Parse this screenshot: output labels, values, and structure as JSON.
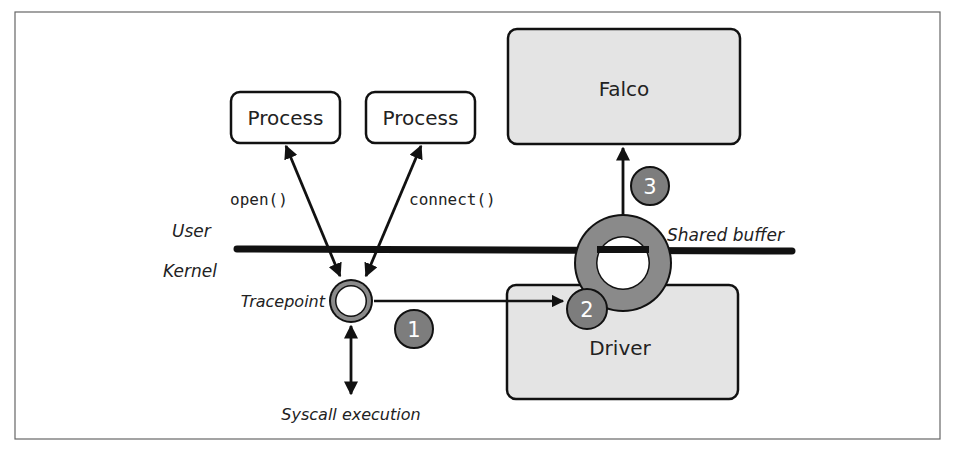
{
  "colors": {
    "frame": "#555555",
    "box_fill_light": "#ffffff",
    "box_fill_gray": "#e4e4e4",
    "stroke": "#111111",
    "ring": "#8a8a8a",
    "badge": "#7d7d7d",
    "badge_text": "#ffffff"
  },
  "boxes": {
    "process_1": "Process",
    "process_2": "Process",
    "falco": "Falco",
    "driver": "Driver"
  },
  "labels": {
    "open_call": "open()",
    "connect_call": "connect()",
    "user": "User",
    "kernel": "Kernel",
    "tracepoint": "Tracepoint",
    "shared_buffer": "Shared buffer",
    "syscall_execution": "Syscall execution"
  },
  "steps": [
    {
      "number": "1"
    },
    {
      "number": "2"
    },
    {
      "number": "3"
    }
  ]
}
